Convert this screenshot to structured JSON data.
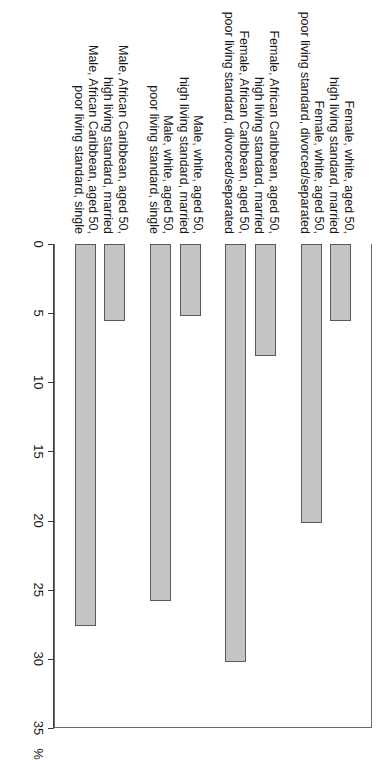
{
  "chart_data": {
    "type": "bar",
    "orientation": "vertical-bars-on-rotated-page",
    "title": "",
    "xlabel": "",
    "ylabel": "%",
    "unit_label": "%",
    "ylim": [
      0,
      35
    ],
    "tick_values": [
      0,
      5,
      10,
      15,
      20,
      25,
      30,
      35
    ],
    "tick_labels": [
      "0",
      "5",
      "10",
      "15",
      "20",
      "25",
      "30",
      "35"
    ],
    "grid": false,
    "legend": null,
    "bar_fill_color": "#c4c4c4",
    "bar_border_color": "#5a5a5a",
    "categories": [
      "Female, white, aged 50,\nhigh living standard, married",
      "Female, white, aged 50,\npoor living standard, divorced/separated",
      "Female, African Caribbean, aged 50,\nhigh living standard, married",
      "Female, African Caribbean, aged 50,\npoor living standard, divorced/separated",
      "Male, white, aged 50,\nhigh living standard, married",
      "Male, white, aged 50,\npoor living standard, single",
      "Male, African Caribbean, aged 50,\nhigh living standard, married",
      "Male, African Caribbean, aged 50,\npoor living standard, single"
    ],
    "values": [
      5.6,
      20.2,
      8.1,
      30.2,
      5.2,
      25.8,
      5.6,
      27.6
    ],
    "group_gaps_after": [
      2,
      4,
      6
    ]
  }
}
